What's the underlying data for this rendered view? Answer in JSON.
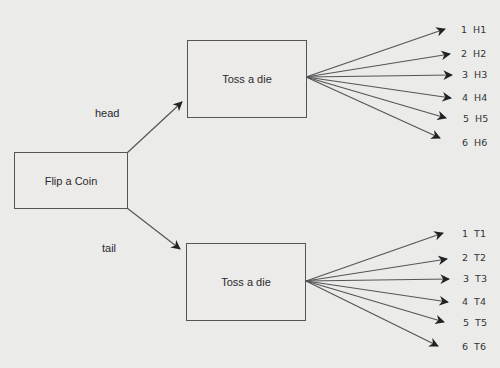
{
  "diagram": {
    "root": {
      "label": "Flip a Coin"
    },
    "branches": [
      {
        "edge_label": "head",
        "node": {
          "label": "Toss a die"
        },
        "outcomes": [
          {
            "num": "1",
            "code": "H1"
          },
          {
            "num": "2",
            "code": "H2"
          },
          {
            "num": "3",
            "code": "H3"
          },
          {
            "num": "4",
            "code": "H4"
          },
          {
            "num": "5",
            "code": "H5"
          },
          {
            "num": "6",
            "code": "H6"
          }
        ]
      },
      {
        "edge_label": "tail",
        "node": {
          "label": "Toss a die"
        },
        "outcomes": [
          {
            "num": "1",
            "code": "T1"
          },
          {
            "num": "2",
            "code": "T2"
          },
          {
            "num": "3",
            "code": "T3"
          },
          {
            "num": "4",
            "code": "T4"
          },
          {
            "num": "5",
            "code": "T5"
          },
          {
            "num": "6",
            "code": "T6"
          }
        ]
      }
    ],
    "colors": {
      "background": "#ebebea",
      "stroke": "#555555",
      "text": "#2a2a2a"
    }
  }
}
